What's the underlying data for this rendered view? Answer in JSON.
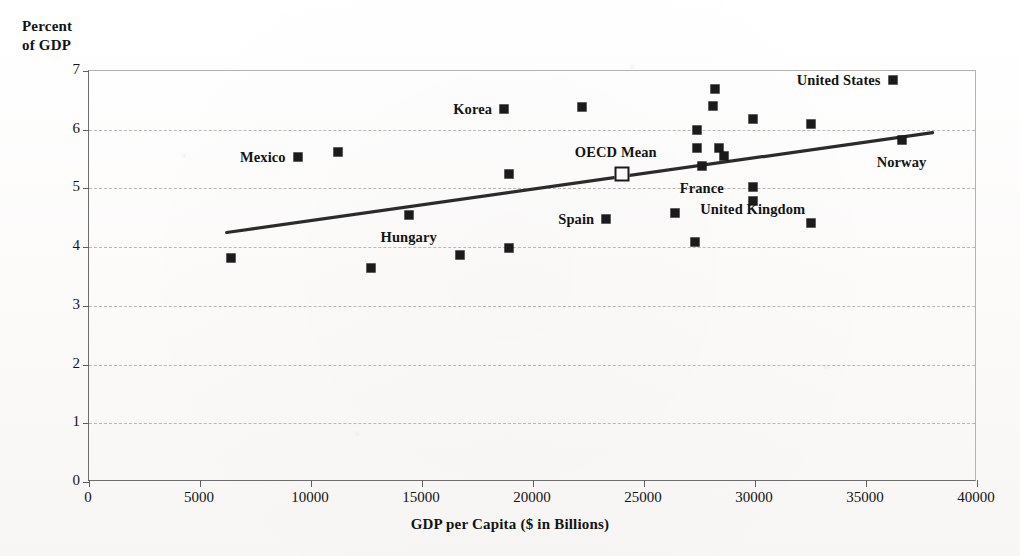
{
  "chart_data": {
    "type": "scatter",
    "title": "",
    "xlabel": "GDP per Capita ($ in Billions)",
    "ylabel_line1": "Percent",
    "ylabel_line2": "of GDP",
    "xlim": [
      0,
      40000
    ],
    "ylim": [
      0,
      7
    ],
    "xticks": [
      0,
      5000,
      10000,
      15000,
      20000,
      25000,
      30000,
      35000,
      40000
    ],
    "xtick_labels": [
      "0",
      "5000",
      "10000",
      "15000",
      "20000",
      "25000",
      "30000",
      "35000",
      "40000"
    ],
    "yticks": [
      0,
      1,
      2,
      3,
      4,
      5,
      6,
      7
    ],
    "ytick_labels": [
      "0",
      "1",
      "2",
      "3",
      "4",
      "5",
      "6",
      "7"
    ],
    "grid": "horizontal-dashed",
    "legend": "none",
    "marker": "filled-square",
    "points": [
      {
        "x": 6400,
        "y": 3.81,
        "label": "",
        "label_pos": "left"
      },
      {
        "x": 9400,
        "y": 5.53,
        "label": "Mexico",
        "label_pos": "left"
      },
      {
        "x": 11200,
        "y": 5.62,
        "label": "",
        "label_pos": "left"
      },
      {
        "x": 12700,
        "y": 3.64,
        "label": "",
        "label_pos": "left"
      },
      {
        "x": 14400,
        "y": 4.55,
        "label": "Hungary",
        "label_pos": "below"
      },
      {
        "x": 16700,
        "y": 3.86,
        "label": "",
        "label_pos": "left"
      },
      {
        "x": 18700,
        "y": 6.36,
        "label": "Korea",
        "label_pos": "left"
      },
      {
        "x": 18900,
        "y": 5.25,
        "label": "",
        "label_pos": "left"
      },
      {
        "x": 18900,
        "y": 3.98,
        "label": "",
        "label_pos": "left"
      },
      {
        "x": 22200,
        "y": 6.38,
        "label": "",
        "label_pos": "left"
      },
      {
        "x": 23300,
        "y": 4.48,
        "label": "Spain",
        "label_pos": "left"
      },
      {
        "x": 26400,
        "y": 4.59,
        "label": "",
        "label_pos": "left"
      },
      {
        "x": 27300,
        "y": 4.09,
        "label": "",
        "label_pos": "left"
      },
      {
        "x": 27400,
        "y": 6.0,
        "label": "",
        "label_pos": "left"
      },
      {
        "x": 27400,
        "y": 5.69,
        "label": "",
        "label_pos": "left"
      },
      {
        "x": 27600,
        "y": 5.39,
        "label": "France",
        "label_pos": "below"
      },
      {
        "x": 28100,
        "y": 6.4,
        "label": "",
        "label_pos": "left"
      },
      {
        "x": 28200,
        "y": 6.7,
        "label": "",
        "label_pos": "left"
      },
      {
        "x": 28400,
        "y": 5.69,
        "label": "",
        "label_pos": "left"
      },
      {
        "x": 28600,
        "y": 5.55,
        "label": "",
        "label_pos": "left"
      },
      {
        "x": 29900,
        "y": 6.18,
        "label": "",
        "label_pos": "left"
      },
      {
        "x": 29900,
        "y": 5.02,
        "label": "United Kingdom",
        "label_pos": "below"
      },
      {
        "x": 29900,
        "y": 4.79,
        "label": "",
        "label_pos": "left"
      },
      {
        "x": 32500,
        "y": 6.1,
        "label": "",
        "label_pos": "left"
      },
      {
        "x": 32500,
        "y": 4.41,
        "label": "",
        "label_pos": "left"
      },
      {
        "x": 36200,
        "y": 6.85,
        "label": "United States",
        "label_pos": "left"
      },
      {
        "x": 36600,
        "y": 5.82,
        "label": "Norway",
        "label_pos": "below"
      }
    ],
    "mean_point": {
      "x": 24000,
      "y": 5.25,
      "label": "OECD Mean",
      "marker": "hollow-square"
    },
    "trendline": {
      "x0": 6200,
      "y0": 4.25,
      "x1": 38000,
      "y1": 5.95,
      "style": "solid",
      "color": "#2b2b2b"
    }
  },
  "colors": {
    "marker": "#1b1b1b",
    "trendline": "#2b2b2b",
    "gridline": "#b9b9b9",
    "axis": "#6d6d6d",
    "background": "#fdfdfc"
  }
}
